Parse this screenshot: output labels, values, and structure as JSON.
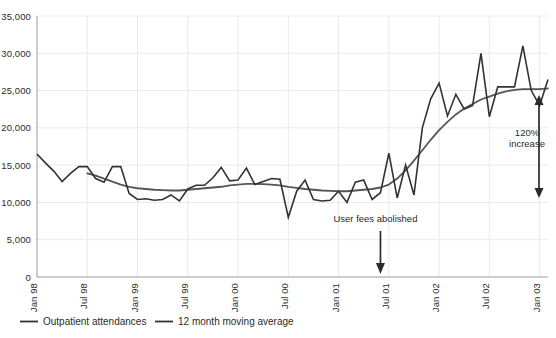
{
  "chart_data": {
    "type": "line",
    "title": "",
    "subtitle": "",
    "xlabel": "",
    "ylabel": "",
    "ylim": [
      0,
      35000
    ],
    "grid": true,
    "legend_position": "bottom-left",
    "y_ticks": [
      "0",
      "5,000",
      "10,000",
      "15,000",
      "20,000",
      "25,000",
      "30,000",
      "35,000"
    ],
    "y_tick_values": [
      0,
      5000,
      10000,
      15000,
      20000,
      25000,
      30000,
      35000
    ],
    "x_ticks": [
      "Jan 98",
      "Jul 98",
      "Jan 99",
      "Jul 99",
      "Jan 00",
      "Jul 00",
      "Jan 01",
      "Jul 01",
      "Jan 02",
      "Jul 02",
      "Jan 03"
    ],
    "x_tick_month_index": [
      0,
      6,
      12,
      18,
      24,
      30,
      36,
      42,
      48,
      54,
      60
    ],
    "x_range_months": [
      0,
      61
    ],
    "series": [
      {
        "name": "Outpatient attendances",
        "color": "#333333",
        "values": [
          16500,
          15300,
          14200,
          12800,
          13900,
          14800,
          14800,
          13200,
          12700,
          14800,
          14800,
          11200,
          10400,
          10500,
          10300,
          10400,
          11000,
          10200,
          11800,
          12300,
          12300,
          13300,
          14700,
          12900,
          13000,
          14600,
          12400,
          12800,
          13200,
          13100,
          8000,
          11500,
          13000,
          10400,
          10200,
          10300,
          11500,
          10000,
          12700,
          13000,
          10400,
          11300,
          16600,
          10600,
          15000,
          11000,
          20000,
          23900,
          26000,
          21600,
          24500,
          22500,
          23000,
          30000,
          21500,
          25500,
          25500,
          25500,
          31000,
          25000,
          23000,
          26500
        ]
      },
      {
        "name": "12 month moving average",
        "color": "#555555",
        "values": [
          null,
          null,
          null,
          null,
          null,
          null,
          13900,
          13600,
          13200,
          12800,
          12400,
          12100,
          11900,
          11800,
          11700,
          11650,
          11600,
          11600,
          11700,
          11800,
          11900,
          12000,
          12100,
          12300,
          12400,
          12500,
          12500,
          12450,
          12400,
          12300,
          12100,
          11950,
          11800,
          11700,
          11600,
          11550,
          11500,
          11500,
          11600,
          11700,
          11800,
          12000,
          12400,
          13200,
          14300,
          15600,
          17000,
          18400,
          19700,
          20800,
          21800,
          22600,
          23200,
          23800,
          24200,
          24600,
          24900,
          25100,
          25200,
          25200,
          25200,
          25300
        ]
      }
    ],
    "annotations": [
      {
        "id": "user-fees-abolished",
        "text": "User fees abolished",
        "month_index": 41,
        "arrow": "down"
      },
      {
        "id": "percent-increase",
        "text_line1": "120%",
        "text_line2": "increase",
        "month_index": 60,
        "arrow": "double-vertical"
      }
    ]
  },
  "legend": {
    "items": [
      {
        "label": "Outpatient attendances",
        "color": "#333333"
      },
      {
        "label": "12 month moving average",
        "color": "#555555"
      }
    ]
  }
}
